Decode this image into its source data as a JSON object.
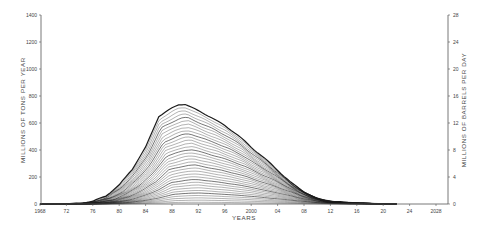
{
  "chart_data": {
    "type": "line",
    "title": "",
    "xlabel": "YEARS",
    "ylabel": "MILLIONS OF TONS PER YEAR",
    "ylabel_right": "MILLIONS OF BARRELS PER DAY",
    "xlim": [
      1968,
      2030
    ],
    "ylim": [
      0,
      1400
    ],
    "ylim_right": [
      0,
      28
    ],
    "x_ticks": [
      1968,
      1972,
      1976,
      1980,
      1984,
      1988,
      1992,
      1996,
      2000,
      2004,
      2008,
      2012,
      2016,
      2020,
      2024,
      2028
    ],
    "x_tick_labels": [
      "1968",
      "72",
      "76",
      "80",
      "84",
      "88",
      "92",
      "96",
      "2000",
      "04",
      "08",
      "12",
      "16",
      "20",
      "24",
      "2028"
    ],
    "y_ticks": [
      0,
      200,
      400,
      600,
      800,
      1000,
      1200,
      1400
    ],
    "y_tick_labels": [
      "0",
      "200",
      "400",
      "600",
      "800",
      "1000",
      "1200",
      "1400"
    ],
    "y_right_ticks": [
      0,
      4,
      8,
      12,
      16,
      20,
      24,
      28
    ],
    "y_right_tick_labels": [
      "0",
      "4",
      "8",
      "12",
      "16",
      "20",
      "24",
      "28"
    ],
    "grid": false,
    "legend": null,
    "series": [
      {
        "name": "Top envelope (total)",
        "x": [
          1968,
          1972,
          1974,
          1976,
          1978,
          1980,
          1982,
          1984,
          1986,
          1988,
          1989,
          1990,
          1992,
          1994,
          1996,
          1998,
          2000,
          2002,
          2004,
          2006,
          2008,
          2010,
          2012,
          2014,
          2016,
          2018,
          2020
        ],
        "values": [
          0,
          0,
          5,
          20,
          60,
          140,
          260,
          420,
          650,
          710,
          735,
          740,
          690,
          640,
          580,
          510,
          420,
          340,
          250,
          160,
          90,
          40,
          20,
          12,
          8,
          3,
          0
        ]
      }
    ],
    "curve_count": 34,
    "line_color": "#1a1a1a"
  }
}
